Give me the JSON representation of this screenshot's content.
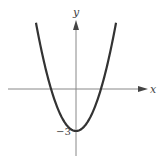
{
  "chart_data": {
    "type": "line",
    "title": "",
    "function": "y = x^2 - 3",
    "xlabel": "x",
    "ylabel": "y",
    "annotations": [
      {
        "text": "-3",
        "x": 0,
        "y": -3,
        "label": "y-intercept"
      }
    ],
    "series": [
      {
        "name": "parabola",
        "x": [
          -2.75,
          -2,
          -1.732,
          -1,
          0,
          1,
          1.732,
          2,
          2.75
        ],
        "y": [
          4.56,
          1,
          0,
          -2,
          -3,
          -2,
          0,
          1,
          4.56
        ]
      }
    ],
    "vertex": [
      0,
      -3
    ],
    "x_intercepts": [
      -1.732,
      1.732
    ],
    "grid": false,
    "legend": null
  },
  "labels": {
    "x_axis": "x",
    "y_axis": "y",
    "y_intercept": "−3"
  },
  "colors": {
    "curve": "#333333",
    "axis": "#777777"
  }
}
